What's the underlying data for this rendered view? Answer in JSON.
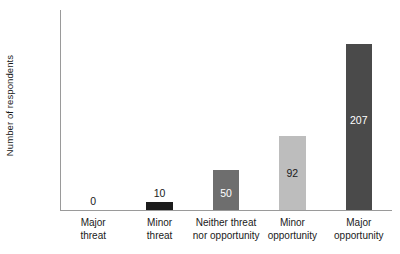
{
  "chart_data": {
    "type": "bar",
    "title": "",
    "xlabel": "",
    "ylabel": "Number of respondents",
    "categories": [
      "Major threat",
      "Minor threat",
      "Neither threat nor opportunity",
      "Minor opportunity",
      "Major opportunity"
    ],
    "category_lines": [
      [
        "Major",
        "threat"
      ],
      [
        "Minor",
        "threat"
      ],
      [
        "Neither threat",
        "nor opportunity"
      ],
      [
        "Minor",
        "opportunity"
      ],
      [
        "Major",
        "opportunity"
      ]
    ],
    "values": [
      0,
      10,
      50,
      92,
      207
    ],
    "value_labels": [
      "0",
      "10",
      "50",
      "92",
      "207"
    ],
    "bar_colors": [
      "#ffffff",
      "#1c1c1c",
      "#6e6e6e",
      "#bdbdbd",
      "#4a4a4a"
    ],
    "label_colors": [
      "#1a1a1a",
      "#1a1a1a",
      "#ffffff",
      "#1a1a1a",
      "#ffffff"
    ],
    "label_placement": [
      "above",
      "above",
      "inside",
      "inside",
      "inside"
    ],
    "ylim": [
      0,
      250
    ],
    "yticks": [
      0,
      50,
      100,
      150,
      200,
      250
    ],
    "ytick_labels": [
      "0",
      "50",
      "100",
      "150",
      "200",
      "250"
    ],
    "grid": false,
    "legend": "none",
    "axis_color": "#9a9a9a"
  }
}
